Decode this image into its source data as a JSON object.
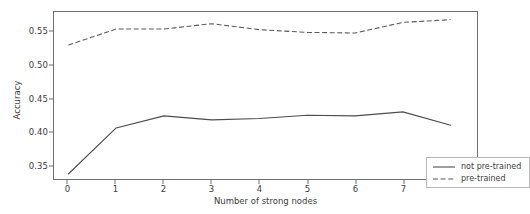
{
  "chart_data": {
    "type": "line",
    "title": "",
    "xlabel": "Number of strong nodes",
    "ylabel": "Accuracy",
    "x": [
      0,
      1,
      2,
      3,
      4,
      5,
      6,
      7,
      8
    ],
    "xtick_labels": [
      "0",
      "1",
      "2",
      "3",
      "4",
      "5",
      "6",
      "7"
    ],
    "xticks": [
      0,
      1,
      2,
      3,
      4,
      5,
      6,
      7
    ],
    "ytick_labels": [
      "0.35",
      "0.40",
      "0.45",
      "0.50",
      "0.55"
    ],
    "yticks": [
      0.35,
      0.4,
      0.45,
      0.5,
      0.55
    ],
    "xlim": [
      -0.3,
      8.55
    ],
    "ylim": [
      0.3295,
      0.5795
    ],
    "grid": false,
    "legend_position": "lower right",
    "series": [
      {
        "name": "not pre-trained",
        "style": "solid",
        "color": "#4d4d4d",
        "values": [
          0.337,
          0.406,
          0.424,
          0.418,
          0.42,
          0.425,
          0.424,
          0.43,
          0.41
        ]
      },
      {
        "name": "pre-trained",
        "style": "dashed",
        "color": "#5a5a5a",
        "values": [
          0.53,
          0.554,
          0.554,
          0.562,
          0.553,
          0.549,
          0.548,
          0.564,
          0.568
        ]
      }
    ]
  },
  "legend": {
    "entries": [
      {
        "label": "not pre-trained"
      },
      {
        "label": "pre-trained"
      }
    ]
  },
  "axis": {
    "y_label": "Accuracy",
    "x_label": "Number of strong nodes"
  }
}
